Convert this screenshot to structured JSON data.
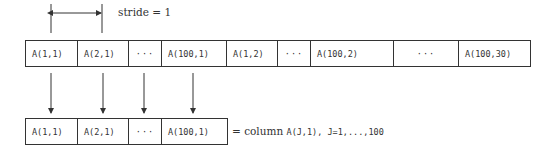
{
  "stride_label": "stride = 1",
  "memory_row": {
    "cells": [
      {
        "text": "A(1,1)",
        "width": 52
      },
      {
        "text": "A(2,1)",
        "width": 51
      },
      {
        "text": "···",
        "width": 33,
        "ellipsis": true
      },
      {
        "text": "A(100,1)",
        "width": 65
      },
      {
        "text": "A(1,2)",
        "width": 51
      },
      {
        "text": "···",
        "width": 33,
        "ellipsis": true
      },
      {
        "text": "A(100,2)",
        "width": 83
      },
      {
        "text": "···",
        "width": 65,
        "ellipsis": true
      },
      {
        "text": "A(100,30)",
        "width": 71
      }
    ]
  },
  "column_row": {
    "cells": [
      {
        "text": "A(1,1)",
        "width": 52
      },
      {
        "text": "A(2,1)",
        "width": 51
      },
      {
        "text": "···",
        "width": 33,
        "ellipsis": true
      },
      {
        "text": "A(100,1)",
        "width": 65
      }
    ],
    "caption_prefix": "= column ",
    "caption_code": "A(J,1), J=1,...,100"
  },
  "colors": {
    "stroke": "#333333",
    "text": "#333333",
    "background": "#ffffff"
  }
}
